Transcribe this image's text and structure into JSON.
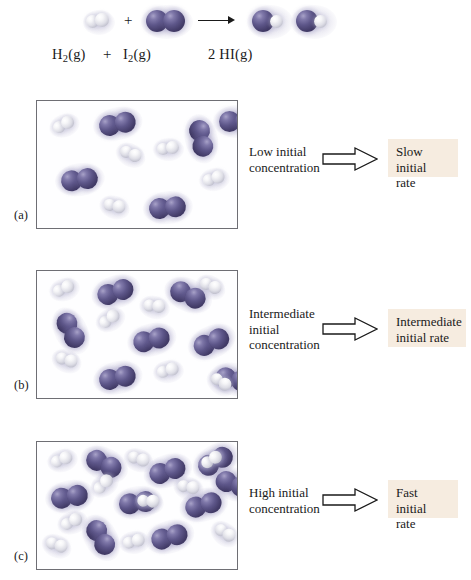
{
  "figure": {
    "type": "chemistry-reaction-concentration-diagram",
    "equation": {
      "reactant1_formula": "H",
      "reactant1_sub": "2",
      "reactant1_state": "(g)",
      "plus": "+",
      "reactant2_formula": "I",
      "reactant2_sub": "2",
      "reactant2_state": "(g)",
      "product_coefficient": "2",
      "product_formula": "HI",
      "product_state": "(g)",
      "arrow_icon": "reaction-arrow-icon"
    },
    "legend": {
      "iodine_color": "#4a4170",
      "hydrogen_color": "#e8e8ef",
      "rate_box_color": "#f6ece0",
      "panel_border_color": "#6e6e74"
    },
    "panels": [
      {
        "tag": "(a)",
        "condition": "Low initial\nconcentration",
        "condition_line1": "Low initial",
        "condition_line2": "concentration",
        "condition_line3": "",
        "rate_line1": "Slow initial",
        "rate_line2": "rate",
        "arrow_icon": "block-arrow-right-icon",
        "i2_count": 5,
        "h2_count": 5,
        "i2_positions": [
          {
            "x": 62,
            "y": 12
          },
          {
            "x": 145,
            "y": 28
          },
          {
            "x": 26,
            "y": 68
          },
          {
            "x": 113,
            "y": 95
          }
        ],
        "h2_positions": [
          {
            "x": 18,
            "y": 17
          },
          {
            "x": 84,
            "y": 48
          },
          {
            "x": 168,
            "y": 72
          },
          {
            "x": 70,
            "y": 99
          }
        ]
      },
      {
        "tag": "(b)",
        "condition_line1": "Intermediate",
        "condition_line2": "initial",
        "condition_line3": "concentration",
        "rate_line1": "Intermediate",
        "rate_line2": "initial rate",
        "arrow_icon": "block-arrow-right-icon",
        "i2_count": 7,
        "h2_count": 7
      },
      {
        "tag": "(c)",
        "condition_line1": "High initial",
        "condition_line2": "concentration",
        "condition_line3": "",
        "rate_line1": "Fast initial",
        "rate_line2": "rate",
        "arrow_icon": "block-arrow-right-icon",
        "i2_count": 9,
        "h2_count": 10
      }
    ]
  },
  "chart_data": {
    "type": "table",
    "categories": [
      "(a) Low",
      "(b) Intermediate",
      "(c) High"
    ],
    "series": [
      {
        "name": "I2 molecules",
        "values": [
          5,
          7,
          9
        ]
      },
      {
        "name": "H2 molecules",
        "values": [
          5,
          7,
          10
        ]
      }
    ],
    "annotations": [
      "Slow initial rate",
      "Intermediate initial rate",
      "Fast initial rate"
    ],
    "xlabel": "Initial concentration",
    "ylabel": "Number of molecules",
    "grid": false,
    "legend": "none"
  }
}
